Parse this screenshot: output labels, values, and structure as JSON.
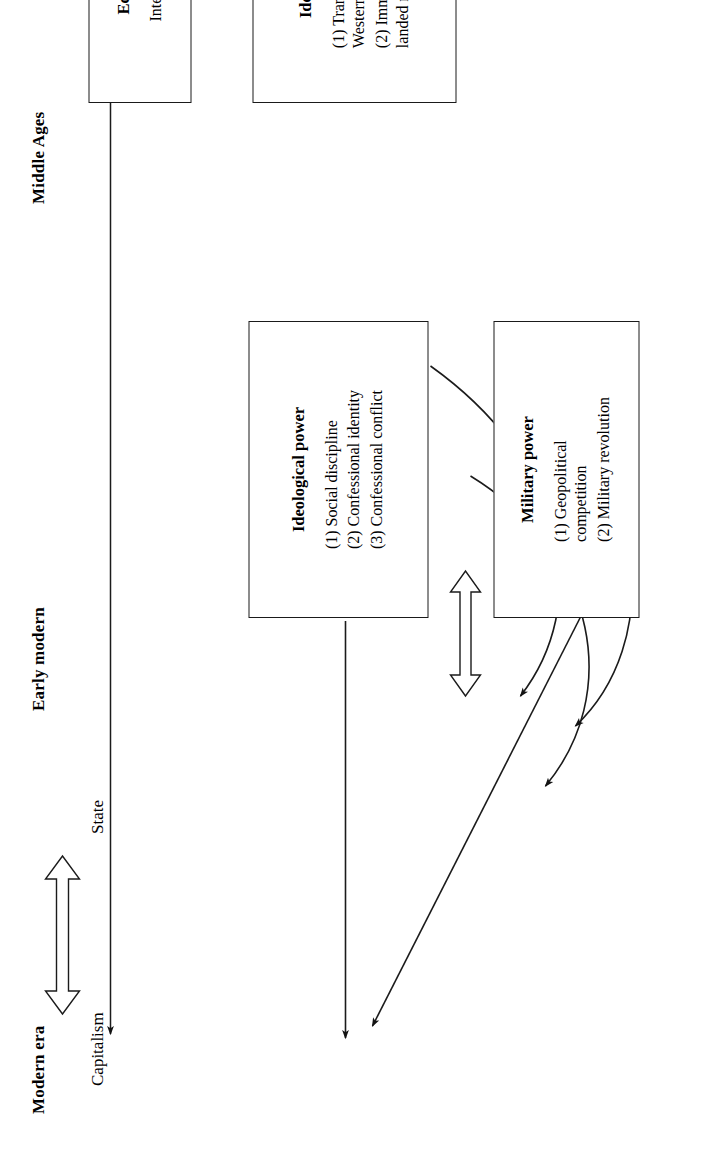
{
  "figure": {
    "orientation": "rotated-90-ccw",
    "background": "#ffffff",
    "ink": "#1a1a1a"
  },
  "eras": [
    {
      "id": "middle-ages",
      "label": "Middle Ages"
    },
    {
      "id": "early-modern",
      "label": "Early modern"
    },
    {
      "id": "modern-era",
      "label": "Modern era"
    }
  ],
  "boxes": {
    "economic_medieval": {
      "title": "Economic power",
      "body": "Intensive agriculture"
    },
    "ideological_medieval": {
      "title": "Ideological power",
      "items": [
        "(1) Transcendent ideology of\n      Western Church",
        "(2) Immanent morale of\n      landed nobility"
      ]
    },
    "ideological_early_modern": {
      "title": "Ideological power",
      "items": [
        "(1) Social discipline",
        "(2) Confessional identity",
        "(3) Confessional conflict"
      ]
    },
    "military_early_modern": {
      "title": "Military power",
      "items": [
        "(1) Geopolitical\n      competition",
        "(2) Military revolution"
      ]
    }
  },
  "outcomes": {
    "capitalism": "Capitalism",
    "state": "State"
  },
  "connectors": [
    {
      "id": "economic-to-capitalism",
      "kind": "straight-arrow",
      "from": "economic_medieval",
      "to": "capitalism"
    },
    {
      "id": "ideological-medieval-to-ideological-early-modern",
      "kind": "straight-arrow",
      "from": "ideological_medieval",
      "to": "ideological_early_modern"
    },
    {
      "id": "ideological-medieval-to-military-curve",
      "kind": "curved-arrow",
      "from": "ideological_medieval",
      "to": "military_early_modern"
    },
    {
      "id": "military-to-ideological-curve",
      "kind": "curved-arrow",
      "from": "military_early_modern",
      "to": "ideological_early_modern"
    },
    {
      "id": "ideological-early-modern-to-state",
      "kind": "straight-arrow",
      "from": "ideological_early_modern",
      "to": "state"
    },
    {
      "id": "military-to-state",
      "kind": "straight-arrow",
      "from": "military_early_modern",
      "to": "state"
    },
    {
      "id": "ideological-military-mutual",
      "kind": "hollow-double-arrow",
      "from": "ideological_early_modern",
      "to": "military_early_modern"
    },
    {
      "id": "capitalism-state-mutual",
      "kind": "hollow-double-arrow",
      "from": "capitalism",
      "to": "state"
    }
  ]
}
